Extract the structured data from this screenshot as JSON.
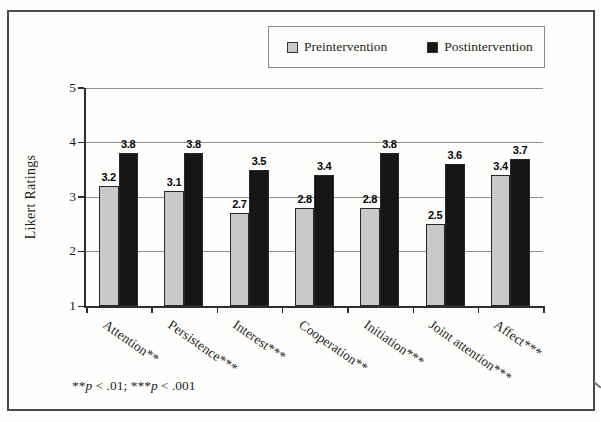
{
  "chart_data": {
    "type": "bar",
    "title": "",
    "xlabel": "",
    "ylabel": "Likert Ratings",
    "ylim": [
      1,
      5
    ],
    "yticks": [
      1,
      2,
      3,
      4,
      5
    ],
    "grid": true,
    "legend_position": "top",
    "value_label_decimals": 1,
    "categories": [
      "Attention**",
      "Persistence***",
      "Interest***",
      "Cooperation**",
      "Initiation***",
      "Joint attention***",
      "Affect***"
    ],
    "series": [
      {
        "name": "Preintervention",
        "color": "#c9c9c9",
        "values": [
          3.2,
          3.1,
          2.7,
          2.8,
          2.8,
          2.5,
          3.4
        ]
      },
      {
        "name": "Postintervention",
        "color": "#161616",
        "values": [
          3.8,
          3.8,
          3.5,
          3.4,
          3.8,
          3.6,
          3.7
        ]
      }
    ]
  },
  "footnote": {
    "stars1": "**",
    "p1": "p",
    "seg1": " < .01; ",
    "stars2": "***",
    "p2": "p",
    "seg2": " < .001"
  }
}
